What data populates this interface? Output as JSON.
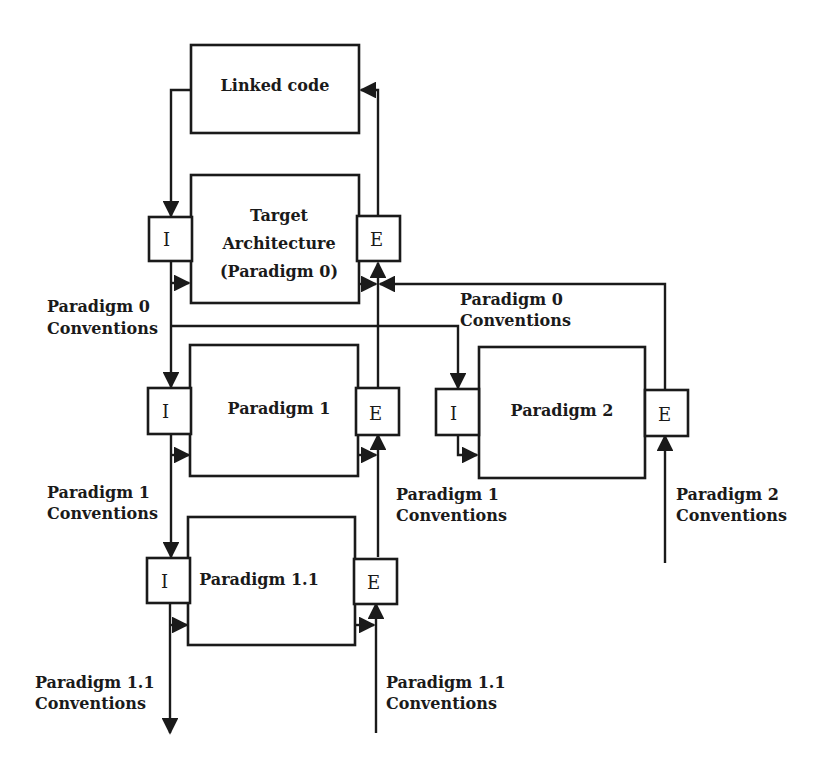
{
  "diagram": {
    "type": "architecture-flow",
    "nodes": {
      "linked_code": {
        "label": "Linked code"
      },
      "target_arch": {
        "line1": "Target",
        "line2": "Architecture",
        "line3": "(Paradigm 0)"
      },
      "paradigm1": {
        "label": "Paradigm 1"
      },
      "paradigm2": {
        "label": "Paradigm 2"
      },
      "paradigm11": {
        "label": "Paradigm 1.1"
      }
    },
    "ports": {
      "import": "I",
      "export": "E"
    },
    "edge_labels": {
      "p0_conv_left": {
        "line1": "Paradigm 0",
        "line2": "Conventions"
      },
      "p0_conv_right": {
        "line1": "Paradigm 0",
        "line2": "Conventions"
      },
      "p1_conv_left": {
        "line1": "Paradigm 1",
        "line2": "Conventions"
      },
      "p1_conv_right": {
        "line1": "Paradigm 1",
        "line2": "Conventions"
      },
      "p2_conv": {
        "line1": "Paradigm 2",
        "line2": "Conventions"
      },
      "p11_conv_left": {
        "line1": "Paradigm 1.1",
        "line2": "Conventions"
      },
      "p11_conv_right": {
        "line1": "Paradigm 1.1",
        "line2": "Conventions"
      }
    },
    "edges": [
      {
        "from": "Linked code",
        "to": "Target Architecture I"
      },
      {
        "from": "Target Architecture E",
        "to": "Linked code"
      },
      {
        "from": "Target Architecture I",
        "to": "Paradigm 1 I",
        "label": "Paradigm 0 Conventions"
      },
      {
        "from": "Target Architecture I",
        "to": "Paradigm 2 I",
        "label": "Paradigm 0 Conventions"
      },
      {
        "from": "Paradigm 2 E",
        "to": "Target Architecture E",
        "label": "Paradigm 0 Conventions"
      },
      {
        "from": "Paradigm 1 E",
        "to": "Target Architecture E"
      },
      {
        "from": "Paradigm 1 I",
        "to": "Paradigm 1.1 I",
        "label": "Paradigm 1 Conventions"
      },
      {
        "from": "Paradigm 1.1 E",
        "to": "Paradigm 1 E",
        "label": "Paradigm 1 Conventions"
      },
      {
        "from": "Paradigm 1.1 I",
        "to": "below",
        "label": "Paradigm 1.1 Conventions"
      },
      {
        "from": "below",
        "to": "Paradigm 1.1 E",
        "label": "Paradigm 1.1 Conventions"
      },
      {
        "from": "below",
        "to": "Paradigm 2 E",
        "label": "Paradigm 2 Conventions"
      }
    ]
  }
}
